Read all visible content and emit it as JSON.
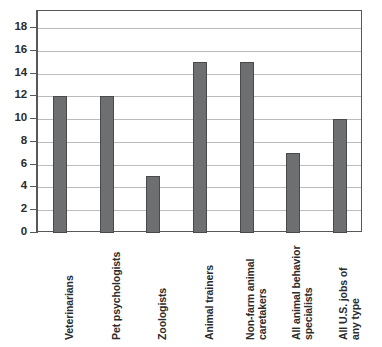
{
  "chart_data": {
    "type": "bar",
    "title": "",
    "subtitle": "",
    "xlabel": "",
    "ylabel": "",
    "categories": [
      "Veterinarians",
      "Pet psychologists",
      "Zoologists",
      "Animal trainers",
      "Non-farm animal caretakers",
      "All animal behavior specialists",
      "All U.S. jobs of any type"
    ],
    "category_lines": [
      [
        "Veterinarians"
      ],
      [
        "Pet psychologists"
      ],
      [
        "Zoologists"
      ],
      [
        "Animal trainers"
      ],
      [
        "Non-farm animal",
        "caretakers"
      ],
      [
        "All animal behavior",
        "specialists"
      ],
      [
        "All U.S. jobs of",
        "any type"
      ]
    ],
    "values": [
      12,
      12,
      5,
      15,
      15,
      7,
      10
    ],
    "ylim": [
      0,
      19.5
    ],
    "yticks": [
      0,
      2,
      4,
      6,
      8,
      10,
      12,
      14,
      16,
      18
    ],
    "ytick_labels": [
      "0",
      "2",
      "4",
      "6",
      "8",
      "10",
      "12",
      "14",
      "16",
      "18"
    ],
    "grid": true,
    "legend": "none",
    "bar_color": "#6e6f71",
    "bar_edge_color": "#4a4a4c",
    "grid_color": "#b9bbbd",
    "axis_color": "#58585a",
    "background_color": "#ffffff"
  }
}
